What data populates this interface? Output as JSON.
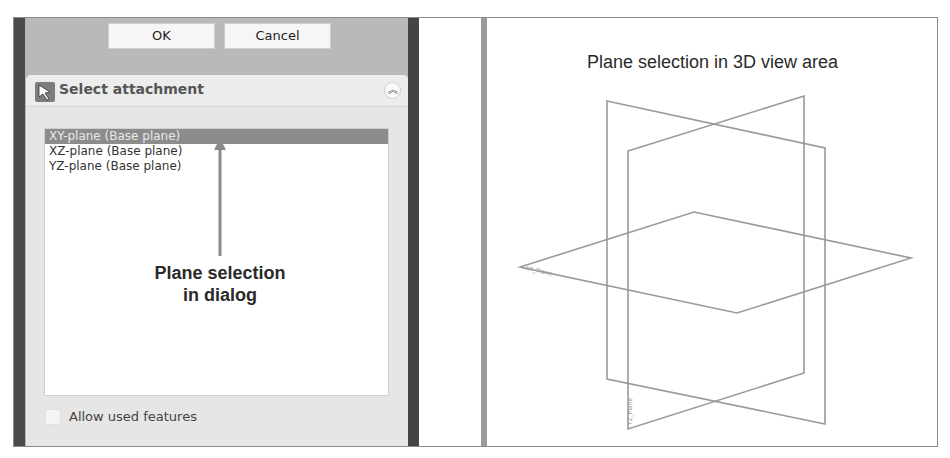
{
  "dialog": {
    "ok_label": "OK",
    "cancel_label": "Cancel",
    "task_panel": {
      "title": "Select attachment",
      "icon": "select-arrow-icon",
      "collapse_icon": "double-chevron-up-icon",
      "collapse_glyph": "︽"
    },
    "list": {
      "items": [
        {
          "label": "XY-plane (Base plane)",
          "selected": true
        },
        {
          "label": "XZ-plane (Base plane)",
          "selected": false
        },
        {
          "label": "YZ-plane (Base plane)",
          "selected": false
        }
      ]
    },
    "allow_used_features": {
      "label": "Allow used features",
      "checked": false
    }
  },
  "annotations": {
    "dialog_line1": "Plane selection",
    "dialog_line2": "in dialog",
    "view_title": "Plane selection in 3D view area"
  },
  "view3d": {
    "line_color": "#9a9a9a",
    "planes": [
      {
        "name": "XY-plane",
        "points": [
          [
            694,
            212
          ],
          [
            911,
            258
          ],
          [
            737,
            313
          ],
          [
            520,
            267
          ]
        ]
      },
      {
        "name": "XZ-plane",
        "points": [
          [
            607,
            101
          ],
          [
            825,
            148
          ],
          [
            825,
            424
          ],
          [
            607,
            379
          ]
        ]
      },
      {
        "name": "YZ-plane",
        "points": [
          [
            628,
            151
          ],
          [
            804,
            96
          ],
          [
            804,
            373
          ],
          [
            628,
            429
          ]
        ]
      }
    ]
  },
  "colors": {
    "selection": "#8c8c8c",
    "panel_bg": "#b9b9b9",
    "task_bg": "#e6e6e6"
  }
}
